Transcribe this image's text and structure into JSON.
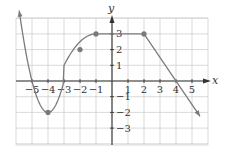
{
  "chart_data": {
    "type": "line",
    "title": "",
    "xlabel": "x",
    "ylabel": "y",
    "xlim": [
      -6,
      6
    ],
    "ylim": [
      -4,
      4
    ],
    "grid": true,
    "xticks": [
      -5,
      -4,
      -3,
      -2,
      -1,
      1,
      2,
      3,
      4,
      5
    ],
    "yticks": [
      3,
      2,
      1,
      -1,
      -2,
      -3
    ],
    "xtick_labels": [
      "−5",
      "−4",
      "−3",
      "−2",
      "−1",
      "1",
      "2",
      "3",
      "4",
      "5"
    ],
    "ytick_labels": [
      "3",
      "2",
      "1",
      "−1",
      "−2",
      "−3"
    ],
    "series": [
      {
        "name": "f(x)",
        "description": "Parabola-like curve from arrow at left, through (-5,0), minimum (-4,-2), (-3,0), (-2,2), to (-1,3); horizontal segment to (2,3); then line down through (4,0) continuing with arrow",
        "points": [
          {
            "x": -5.8,
            "y": 1.8
          },
          {
            "x": -5,
            "y": 0
          },
          {
            "x": -4,
            "y": -2
          },
          {
            "x": -3,
            "y": 0
          },
          {
            "x": -2,
            "y": 2
          },
          {
            "x": -1,
            "y": 3
          },
          {
            "x": 2,
            "y": 3
          },
          {
            "x": 4,
            "y": 0
          },
          {
            "x": 5.5,
            "y": -2.25
          }
        ],
        "marked_points": [
          {
            "x": -4,
            "y": -2
          },
          {
            "x": -2,
            "y": 2
          },
          {
            "x": -1,
            "y": 3
          },
          {
            "x": 2,
            "y": 3
          }
        ],
        "arrows": [
          "left-start",
          "right-end"
        ]
      }
    ],
    "colors": {
      "curve": "#7a7a7a",
      "grid": "#cfcfcf",
      "axis": "#333333"
    }
  },
  "labels": {
    "x_axis": "x",
    "y_axis": "y"
  }
}
